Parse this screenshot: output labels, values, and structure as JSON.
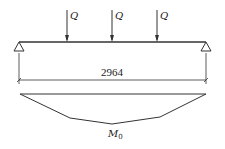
{
  "diagram": {
    "type": "beam-bending-moment",
    "loads": [
      {
        "label": "Q",
        "x": 67
      },
      {
        "label": "Q",
        "x": 112
      },
      {
        "label": "Q",
        "x": 157
      }
    ],
    "span_label": "2964",
    "moment_label": "M",
    "moment_subscript": "0",
    "colors": {
      "line": "#333333",
      "background": "#ffffff"
    }
  }
}
